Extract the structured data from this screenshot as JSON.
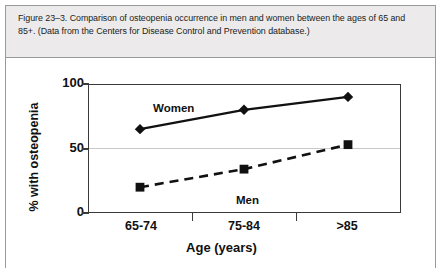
{
  "figure": {
    "caption": "Figure 23–3. Comparison of osteopenia occurrence in men and women between the ages of 65 and 85+. (Data from the Centers for Disease Control and Prevention database.)"
  },
  "colors": {
    "caption_background": "#eceaea",
    "figure_border": "#9a9a9a",
    "axis": "#3a3a3a",
    "gridline": "#c9c9c9",
    "series": "#111111",
    "plot_background": "#ffffff"
  },
  "chart_data": {
    "type": "line",
    "title": "",
    "xlabel": "Age (years)",
    "ylabel": "% with osteopenia",
    "categories": [
      "65-74",
      "75-84",
      ">85"
    ],
    "series": [
      {
        "name": "Women",
        "values": [
          65,
          80,
          90
        ],
        "marker": "diamond",
        "linestyle": "solid"
      },
      {
        "name": "Men",
        "values": [
          20,
          34,
          53
        ],
        "marker": "square",
        "linestyle": "dashed"
      }
    ],
    "ylim": [
      0,
      100
    ],
    "yticks": [
      0,
      50,
      100
    ],
    "ytick_labels": [
      "0",
      "50",
      "100"
    ],
    "grid": "horizontal-at-50",
    "legend": "inline-series-labels"
  }
}
